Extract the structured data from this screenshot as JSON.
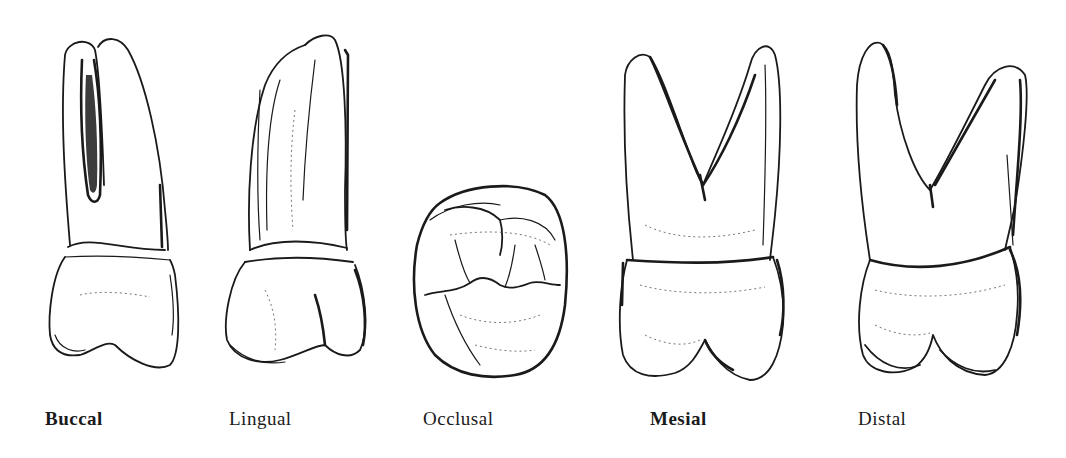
{
  "figure": {
    "views": [
      {
        "id": "buccal",
        "label": "Buccal"
      },
      {
        "id": "lingual",
        "label": "Lingual"
      },
      {
        "id": "occlusal",
        "label": "Occlusal"
      },
      {
        "id": "mesial",
        "label": "Mesial"
      },
      {
        "id": "distal",
        "label": "Distal"
      }
    ]
  },
  "colors": {
    "background": "#ffffff",
    "ink": "#1a1a1a"
  }
}
